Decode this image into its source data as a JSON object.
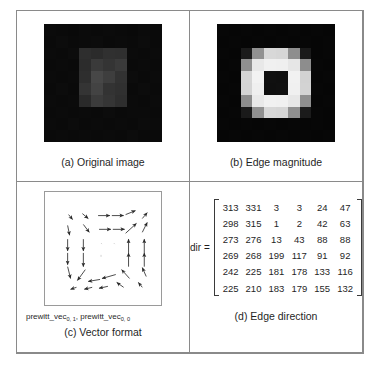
{
  "panels": {
    "a": {
      "caption": "(a) Original image",
      "image_name": "original-image-raster",
      "background": "#060606",
      "grid_size": 10,
      "pixels": [
        [
          "#0b0b0b",
          "#0a0a0a",
          "#090909",
          "#0b0b0b",
          "#0a0a0a",
          "#0b0b0b",
          "#0a0a0a",
          "#090909",
          "#0b0b0b",
          "#0a0a0a"
        ],
        [
          "#0a0a0a",
          "#0c0c0c",
          "#0a0a0a",
          "#0b0b0b",
          "#0c0c0c",
          "#0a0a0a",
          "#0b0b0b",
          "#0a0a0a",
          "#0c0c0c",
          "#0a0a0a"
        ],
        [
          "#0b0b0b",
          "#0a0a0a",
          "#0c0c0c",
          "#2e2e2e",
          "#2b2b2b",
          "#303030",
          "#2f2f2f",
          "#0b0b0b",
          "#0a0a0a",
          "#0b0b0b"
        ],
        [
          "#0a0a0a",
          "#0b0b0b",
          "#0a0a0a",
          "#2c2c2c",
          "#3a3a3a",
          "#343434",
          "#3a3a3a",
          "#0a0a0a",
          "#0b0b0b",
          "#0a0a0a"
        ],
        [
          "#0b0b0b",
          "#0a0a0a",
          "#0b0b0b",
          "#2e2e2e",
          "#474747",
          "#3e3e3e",
          "#323232",
          "#0c0c0c",
          "#0a0a0a",
          "#0b0b0b"
        ],
        [
          "#0a0a0a",
          "#0c0c0c",
          "#0a0a0a",
          "#343434",
          "#434343",
          "#333333",
          "#303030",
          "#0a0a0a",
          "#0c0c0c",
          "#0a0a0a"
        ],
        [
          "#0b0b0b",
          "#0a0a0a",
          "#0b0b0b",
          "#2a2a2a",
          "#3b3b3b",
          "#353535",
          "#2e2e2e",
          "#0b0b0b",
          "#0a0a0a",
          "#0b0b0b"
        ],
        [
          "#0a0a0a",
          "#0b0b0b",
          "#0a0a0a",
          "#0b0b0b",
          "#0a0a0a",
          "#0c0c0c",
          "#0a0a0a",
          "#0b0b0b",
          "#0b0b0b",
          "#0a0a0a"
        ],
        [
          "#0b0b0b",
          "#0a0a0a",
          "#0c0c0c",
          "#0a0a0a",
          "#0b0b0b",
          "#0a0a0a",
          "#0b0b0b",
          "#0a0a0a",
          "#0c0c0c",
          "#0b0b0b"
        ],
        [
          "#0a0a0a",
          "#0b0b0b",
          "#0a0a0a",
          "#0b0b0b",
          "#0a0a0a",
          "#0b0b0b",
          "#0a0a0a",
          "#0c0c0c",
          "#0a0a0a",
          "#0a0a0a"
        ]
      ]
    },
    "b": {
      "caption": "(b) Edge magnitude",
      "image_name": "edge-magnitude-raster",
      "background": "#060606",
      "grid_size": 10,
      "pixels": [
        [
          "#070707",
          "#060606",
          "#070707",
          "#060606",
          "#070707",
          "#060606",
          "#070707",
          "#060606",
          "#070707",
          "#060606"
        ],
        [
          "#060606",
          "#070707",
          "#060606",
          "#070707",
          "#060606",
          "#070707",
          "#060606",
          "#070707",
          "#060606",
          "#070707"
        ],
        [
          "#070707",
          "#060606",
          "#1b1b1b",
          "#919191",
          "#d8d8d8",
          "#d6d6d6",
          "#8e8e8e",
          "#1a1a1a",
          "#060606",
          "#070707"
        ],
        [
          "#060606",
          "#070707",
          "#8f8f8f",
          "#e8e8e8",
          "#f0f0f0",
          "#efefef",
          "#e6e6e6",
          "#8d8d8d",
          "#070707",
          "#060606"
        ],
        [
          "#070707",
          "#060606",
          "#d5d5d5",
          "#f2f2f2",
          "#101010",
          "#0f0f0f",
          "#f1f1f1",
          "#d2d2d2",
          "#060606",
          "#070707"
        ],
        [
          "#060606",
          "#070707",
          "#d4d4d4",
          "#efefef",
          "#0f0f0f",
          "#101010",
          "#f0f0f0",
          "#d3d3d3",
          "#070707",
          "#060606"
        ],
        [
          "#070707",
          "#060606",
          "#8d8d8d",
          "#e9e9e9",
          "#f1f1f1",
          "#f0f0f0",
          "#e7e7e7",
          "#8e8e8e",
          "#060606",
          "#070707"
        ],
        [
          "#060606",
          "#070707",
          "#1a1a1a",
          "#909090",
          "#d7d7d7",
          "#d5d5d5",
          "#8f8f8f",
          "#1b1b1b",
          "#070707",
          "#060606"
        ],
        [
          "#070707",
          "#060606",
          "#070707",
          "#060606",
          "#070707",
          "#060606",
          "#070707",
          "#060606",
          "#070707",
          "#060606"
        ],
        [
          "#060606",
          "#070707",
          "#060606",
          "#070707",
          "#060606",
          "#070707",
          "#060606",
          "#070707",
          "#060606",
          "#070707"
        ]
      ]
    },
    "c": {
      "caption": "(c) Vector format",
      "vector_label_prefix": "prewitt_vec",
      "vector_label_sub1": "0, 1",
      "vector_label_sep": ", prewitt_vec",
      "vector_label_sub2": "0, 0",
      "field_name": "gradient-vector-field"
    },
    "d": {
      "caption": "(d) Edge direction",
      "dir_label": "dir =",
      "matrix": [
        [
          313,
          331,
          3,
          3,
          24,
          47
        ],
        [
          298,
          315,
          1,
          2,
          42,
          63
        ],
        [
          273,
          276,
          13,
          43,
          88,
          88
        ],
        [
          269,
          268,
          199,
          117,
          91,
          92
        ],
        [
          242,
          225,
          181,
          178,
          133,
          116
        ],
        [
          225,
          210,
          183,
          179,
          155,
          132
        ]
      ]
    }
  },
  "chart_data": {
    "type": "heatmap",
    "panels": [
      {
        "id": "a",
        "label": "(a) Original image",
        "type": "heatmap",
        "description": "10x10 dark raster with a brighter square region in the centre-left",
        "colormap": "gray",
        "value_range": [
          0,
          255
        ]
      },
      {
        "id": "b",
        "label": "(b) Edge magnitude",
        "type": "heatmap",
        "description": "10x10 raster: bright ring of edge response surrounding a dark 2x2 core on a black background",
        "colormap": "gray",
        "value_range": [
          0,
          255
        ]
      },
      {
        "id": "c",
        "label": "(c) Vector format",
        "type": "quiver",
        "description": "Gradient vectors pointing outward/inward around the square edge; arrows on the top edge point right, right edge point up, bottom edge point left, left edge point down",
        "xlabel": "prewitt_vec(0,1), prewitt_vec(0,0)"
      },
      {
        "id": "d",
        "label": "(d) Edge direction",
        "type": "table",
        "ylabel": "dir =",
        "units": "degrees",
        "rows": [
          [
            313,
            331,
            3,
            3,
            24,
            47
          ],
          [
            298,
            315,
            1,
            2,
            42,
            63
          ],
          [
            273,
            276,
            13,
            43,
            88,
            88
          ],
          [
            269,
            268,
            199,
            117,
            91,
            92
          ],
          [
            242,
            225,
            181,
            178,
            133,
            116
          ],
          [
            225,
            210,
            183,
            179,
            155,
            132
          ]
        ]
      }
    ]
  }
}
